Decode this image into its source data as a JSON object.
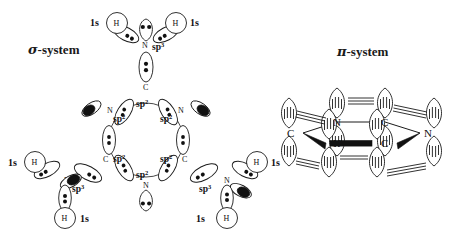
{
  "figure": {
    "title_left": "σ-system",
    "title_right": "π-system",
    "molecule": "melamine (1,3,5-triazine-2,4,6-triamine)",
    "background_color": "#ffffff",
    "ink_color": "#1b1b1b"
  },
  "sigma_system": {
    "label": "σ-system",
    "label_greek": "σ",
    "label_rest": "-system",
    "ring": {
      "atoms": [
        "C",
        "N",
        "C",
        "N",
        "C",
        "N"
      ],
      "hybrid_labels": [
        "sp",
        "sp",
        "sp",
        "sp",
        "sp",
        "sp"
      ],
      "hybrid_superscript": "2",
      "inner_labels": [
        "sp2",
        "sp2",
        "sp2",
        "sp2",
        "sp2",
        "sp2"
      ],
      "inner_label_text": "sp",
      "inner_label_sup": "2"
    },
    "amino_groups": [
      {
        "position": "top",
        "n_label": "N",
        "n_hybrid": "sp",
        "n_hybrid_sup": "3",
        "hydrogens": [
          {
            "atom": "H",
            "orbital": "1s",
            "side": "left"
          },
          {
            "atom": "H",
            "orbital": "1s",
            "side": "right"
          }
        ],
        "lone_pair": true
      },
      {
        "position": "bottom-left",
        "n_label": "N",
        "n_hybrid": "sp",
        "n_hybrid_sup": "3",
        "hydrogens": [
          {
            "atom": "H",
            "orbital": "1s",
            "side": "left"
          },
          {
            "atom": "H",
            "orbital": "1s",
            "side": "bottom"
          }
        ],
        "lone_pair": true
      },
      {
        "position": "bottom-right",
        "n_label": "N",
        "n_hybrid": "sp",
        "n_hybrid_sup": "3",
        "hydrogens": [
          {
            "atom": "H",
            "orbital": "1s",
            "side": "right"
          },
          {
            "atom": "H",
            "orbital": "1s",
            "side": "bottom"
          }
        ],
        "lone_pair": true
      }
    ],
    "orbital_legend": {
      "sp3": "sp3",
      "sp2": "sp2",
      "s": "1s"
    }
  },
  "pi_system": {
    "label": "π-system",
    "label_greek": "π",
    "label_rest": "-system",
    "ring_atoms": [
      {
        "label": "C",
        "x": 303,
        "y": 133
      },
      {
        "label": "N",
        "x": 337,
        "y": 143
      },
      {
        "label": "C",
        "x": 385,
        "y": 143
      },
      {
        "label": "N",
        "x": 420,
        "y": 133
      },
      {
        "label": "C",
        "x": 385,
        "y": 122
      },
      {
        "label": "N",
        "x": 337,
        "y": 122
      }
    ],
    "orbital_type": "p",
    "lobes_per_atom": 2,
    "note": "p orbitals perpendicular to ring plane"
  }
}
